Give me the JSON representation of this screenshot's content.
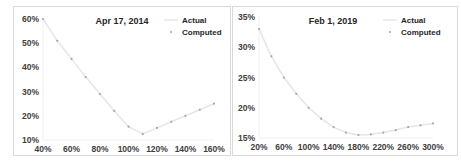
{
  "chart_data": [
    {
      "type": "line",
      "title": "Apr 17, 2014",
      "xlabel": "",
      "ylabel": "",
      "x_ticks": [
        "40%",
        "60%",
        "80%",
        "100%",
        "120%",
        "140%",
        "160%"
      ],
      "y_ticks": [
        "10%",
        "20%",
        "30%",
        "40%",
        "50%",
        "60%"
      ],
      "xlim": [
        40,
        160
      ],
      "ylim": [
        10,
        60
      ],
      "grid": false,
      "legend": {
        "position": "top-right",
        "entries": [
          "Actual",
          "Computed"
        ]
      },
      "x": [
        40,
        50,
        60,
        70,
        80,
        90,
        100,
        110,
        120,
        130,
        140,
        150,
        160
      ],
      "series": [
        {
          "name": "Actual",
          "style": "line",
          "values": [
            60,
            51,
            43.5,
            36,
            29,
            22,
            15.5,
            12.5,
            15,
            17.5,
            20,
            22.5,
            25
          ]
        },
        {
          "name": "Computed",
          "style": "markers",
          "values": [
            60,
            51,
            43.5,
            36,
            29,
            22,
            15.5,
            12.5,
            15,
            17.5,
            20,
            22.5,
            25
          ]
        }
      ]
    },
    {
      "type": "line",
      "title": "Feb 1, 2019",
      "xlabel": "",
      "ylabel": "",
      "x_ticks": [
        "20%",
        "60%",
        "100%",
        "140%",
        "180%",
        "220%",
        "260%",
        "300%"
      ],
      "y_ticks": [
        "15%",
        "20%",
        "25%",
        "30%",
        "35%"
      ],
      "xlim": [
        20,
        300
      ],
      "ylim": [
        15,
        35
      ],
      "grid": false,
      "legend": {
        "position": "top-right",
        "entries": [
          "Actual",
          "Computed"
        ]
      },
      "x": [
        20,
        40,
        60,
        80,
        100,
        120,
        140,
        160,
        180,
        200,
        220,
        240,
        260,
        280,
        300
      ],
      "series": [
        {
          "name": "Actual",
          "style": "line",
          "values": [
            33,
            28.5,
            25,
            22.3,
            20,
            18.2,
            16.8,
            15.9,
            15.5,
            15.6,
            15.9,
            16.3,
            16.8,
            17.1,
            17.4
          ]
        },
        {
          "name": "Computed",
          "style": "markers",
          "values": [
            33,
            28.5,
            25,
            22.3,
            20,
            18.2,
            16.8,
            15.9,
            15.5,
            15.6,
            15.9,
            16.3,
            16.8,
            17.1,
            17.4
          ]
        }
      ]
    }
  ],
  "colors": {
    "actual_line": "#e6e6e6",
    "computed_marker": "#a6a6a6",
    "border": "#d9d9d9"
  }
}
